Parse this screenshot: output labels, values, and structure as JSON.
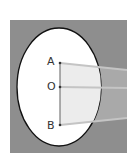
{
  "diagram": {
    "type": "optics-lens-beam",
    "points": [
      {
        "label": "A",
        "x": 60,
        "y": 63
      },
      {
        "label": "O",
        "x": 60,
        "y": 87
      },
      {
        "label": "B",
        "x": 60,
        "y": 125
      }
    ],
    "colors": {
      "background_square": "#8c8c8c",
      "ellipse_fill": "#ffffff",
      "ellipse_stroke": "#111111",
      "beam_fill": "#e8e8e8",
      "beam_lines": "#b8b8b8",
      "axis_line": "#777777"
    }
  },
  "labels": {
    "a": "A",
    "o": "O",
    "b": "B"
  }
}
